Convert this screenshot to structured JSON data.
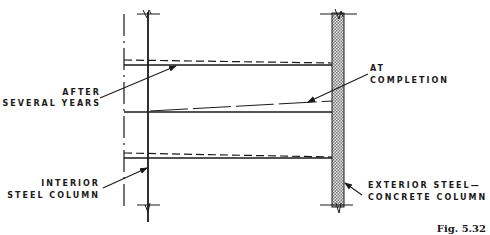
{
  "figure": {
    "caption": "Fig. 5.32",
    "labels": {
      "after_several_years": [
        "AFTER",
        "SEVERAL YEARS"
      ],
      "at_completion": [
        "AT",
        "COMPLETION"
      ],
      "interior_column": [
        "INTERIOR",
        "STEEL COLUMN"
      ],
      "exterior_column": [
        "EXTERIOR STEEL—",
        "CONCRETE COLUMN"
      ]
    },
    "colors": {
      "ink": "#1a1a1a",
      "concrete_fill": "#b8b8b8"
    }
  }
}
